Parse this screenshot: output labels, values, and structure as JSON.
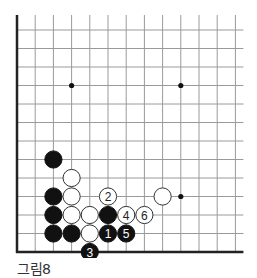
{
  "figure": {
    "caption": "그림8",
    "type": "go-board-diagram",
    "grid": {
      "columns": 13,
      "rows": 13,
      "origin_x": 17,
      "origin_y": 30,
      "spacing_x": 18.2,
      "spacing_y": 18.5,
      "left_edge_thick": true,
      "bottom_edge_thick": true,
      "line_color": "#9a9a9a",
      "edge_color": "#222222"
    },
    "star_points": [
      [
        3,
        3
      ],
      [
        9,
        3
      ],
      [
        9,
        9
      ]
    ],
    "stones": [
      {
        "col": 2,
        "row": 7,
        "color": "black",
        "label": ""
      },
      {
        "col": 3,
        "row": 8,
        "color": "white",
        "label": ""
      },
      {
        "col": 2,
        "row": 9,
        "color": "black",
        "label": ""
      },
      {
        "col": 3,
        "row": 9,
        "color": "white",
        "label": ""
      },
      {
        "col": 5,
        "row": 9,
        "color": "white",
        "label": "2"
      },
      {
        "col": 8,
        "row": 9,
        "color": "white",
        "label": ""
      },
      {
        "col": 2,
        "row": 10,
        "color": "black",
        "label": ""
      },
      {
        "col": 3,
        "row": 10,
        "color": "white",
        "label": ""
      },
      {
        "col": 4,
        "row": 10,
        "color": "white",
        "label": ""
      },
      {
        "col": 5,
        "row": 10,
        "color": "black",
        "label": ""
      },
      {
        "col": 6,
        "row": 10,
        "color": "white",
        "label": "4"
      },
      {
        "col": 7,
        "row": 10,
        "color": "white",
        "label": "6"
      },
      {
        "col": 2,
        "row": 11,
        "color": "black",
        "label": ""
      },
      {
        "col": 3,
        "row": 11,
        "color": "black",
        "label": ""
      },
      {
        "col": 4,
        "row": 11,
        "color": "white",
        "label": ""
      },
      {
        "col": 5,
        "row": 11,
        "color": "black",
        "label": "1"
      },
      {
        "col": 6,
        "row": 11,
        "color": "black",
        "label": "5"
      },
      {
        "col": 4,
        "row": 12,
        "color": "black",
        "label": "3"
      }
    ]
  }
}
